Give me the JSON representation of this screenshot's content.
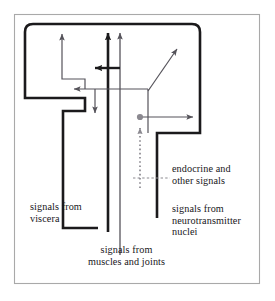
{
  "figure": {
    "colors": {
      "outer_frame": "#a9a9a9",
      "thick_stroke": "#1b1a1c",
      "thin_stroke": "#55535a",
      "dashed_stroke": "#8b8990",
      "text": "#18161a",
      "background": "#ffffff"
    },
    "labels": {
      "viscera": {
        "line1": "signals from",
        "line2": "viscera"
      },
      "muscles": {
        "line1": "signals from",
        "line2": "muscles and joints"
      },
      "endocrine": {
        "line1": "endocrine and",
        "line2": "other signals"
      },
      "neurotransmitter": {
        "line1": "signals from",
        "line2": "neurotransmitter",
        "line3": "nuclei"
      }
    },
    "arrows": [
      {
        "name": "ascending-visceral-thick",
        "direction": "up",
        "style": "thick"
      },
      {
        "name": "ascending-muscle-thin",
        "direction": "up",
        "style": "thin"
      },
      {
        "name": "outgoing-left-thick",
        "direction": "left",
        "style": "thick"
      },
      {
        "name": "outgoing-left-thin",
        "direction": "left",
        "style": "thin"
      },
      {
        "name": "outgoing-up-left-thin",
        "direction": "up",
        "style": "thin"
      },
      {
        "name": "outgoing-down-thin",
        "direction": "down",
        "style": "thin"
      },
      {
        "name": "outgoing-diagonal-thin",
        "direction": "up-right",
        "style": "thin"
      },
      {
        "name": "outgoing-right-thin",
        "direction": "right",
        "style": "thin"
      },
      {
        "name": "ascending-neurotransmitter-dashed",
        "direction": "up",
        "style": "dashed"
      }
    ]
  }
}
